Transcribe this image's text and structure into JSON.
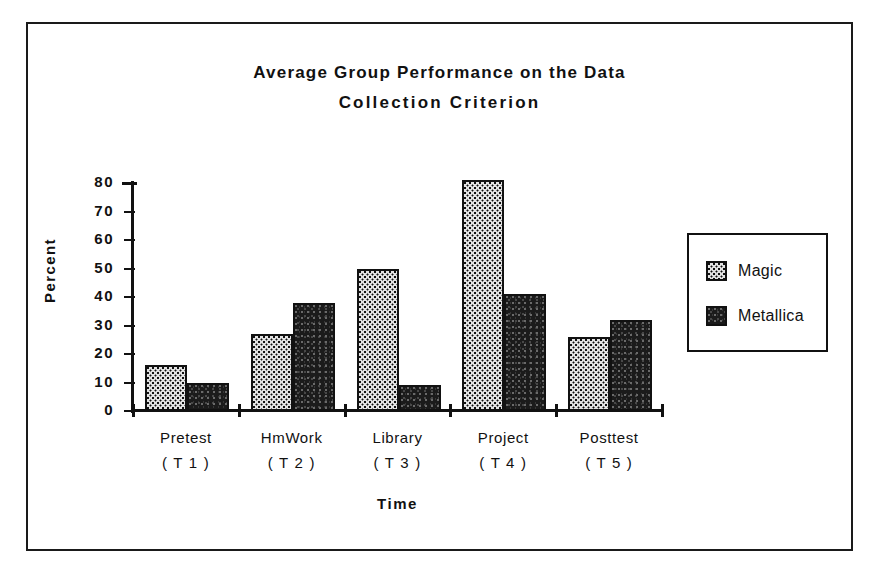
{
  "figure": {
    "title_line1": "Average  Group  Performance  on  the  Data",
    "title_line2": "Collection    Criterion"
  },
  "axes": {
    "ylabel": "Percent",
    "xlabel": "Time",
    "yticks": [
      "0",
      "10",
      "20",
      "30",
      "40",
      "50",
      "60",
      "70",
      "80"
    ]
  },
  "legend": {
    "items": [
      {
        "label": "Magic",
        "swatch": "magic-pattern-swatch"
      },
      {
        "label": "Metallica",
        "swatch": "metallica-pattern-swatch"
      }
    ]
  },
  "categories_display": [
    {
      "name": "Pretest",
      "code": "( T 1 )"
    },
    {
      "name": "HmWork",
      "code": "( T 2 )"
    },
    {
      "name": "Library",
      "code": "( T 3 )"
    },
    {
      "name": "Project",
      "code": "( T 4 )"
    },
    {
      "name": "Posttest",
      "code": "( T 5 )"
    }
  ],
  "colors": {
    "ink": "#111111",
    "magic_fill": "#e2e2e2",
    "metallica_fill": "#1b1b1b",
    "background": "#ffffff"
  },
  "chart_data": {
    "type": "bar",
    "title": "Average Group Performance on the Data Collection Criterion",
    "xlabel": "Time",
    "ylabel": "Percent",
    "ylim": [
      0,
      80
    ],
    "ytick_step": 10,
    "grid": false,
    "legend_position": "right",
    "categories": [
      "Pretest (T1)",
      "HmWork (T2)",
      "Library (T3)",
      "Project (T4)",
      "Posttest (T5)"
    ],
    "series": [
      {
        "name": "Magic",
        "values": [
          16,
          27,
          50,
          81,
          26
        ]
      },
      {
        "name": "Metallica",
        "values": [
          10,
          38,
          9,
          41,
          32
        ]
      }
    ]
  }
}
